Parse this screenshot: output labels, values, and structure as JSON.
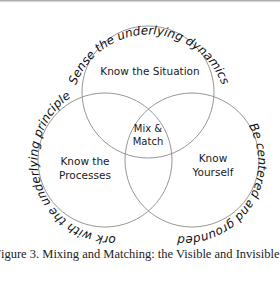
{
  "figure": {
    "circles": [
      {
        "id": "situation",
        "label": "Know the Situation",
        "arc_text": "Sense the underlying dynamics"
      },
      {
        "id": "processes",
        "label_lines": [
          "Know the",
          "Processes"
        ],
        "arc_text": "Work with the underlying principles"
      },
      {
        "id": "yourself",
        "label_lines": [
          "Know",
          "Yourself"
        ],
        "arc_text": "Be centered and grounded"
      }
    ],
    "center": {
      "label_lines": [
        "Mix &",
        "Match"
      ]
    },
    "stroke_color": "#8a8a8a"
  },
  "caption": "Figure 3.  Mixing and Matching: the Visible and Invisible Aspects"
}
